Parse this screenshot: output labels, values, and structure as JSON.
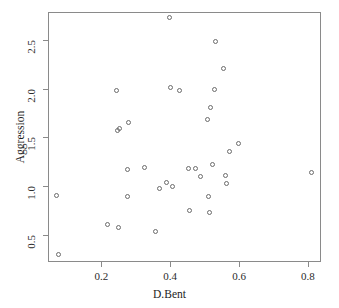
{
  "chart_data": {
    "type": "scatter",
    "title": "",
    "xlabel": "D.Bent",
    "ylabel": "Aggression",
    "xlim": [
      0.045,
      0.838
    ],
    "ylim": [
      0.22,
      2.79
    ],
    "xticks": [
      0.2,
      0.4,
      0.6,
      0.8
    ],
    "xticklabels": [
      "0.2",
      "0.4",
      "0.6",
      "0.8"
    ],
    "yticks": [
      0.5,
      1.0,
      1.5,
      2.0,
      2.5
    ],
    "yticklabels": [
      "0.5",
      "1.0",
      "1.5",
      "2.0",
      "2.5"
    ],
    "grid": false,
    "legend": null,
    "marker": "open-circle",
    "marker_color": "#6b6b6b",
    "n_points": 41,
    "points": [
      {
        "x": 0.07,
        "y": 0.905
      },
      {
        "x": 0.075,
        "y": 0.3
      },
      {
        "x": 0.218,
        "y": 0.607
      },
      {
        "x": 0.245,
        "y": 1.985
      },
      {
        "x": 0.247,
        "y": 1.572
      },
      {
        "x": 0.252,
        "y": 1.592
      },
      {
        "x": 0.25,
        "y": 0.572
      },
      {
        "x": 0.278,
        "y": 1.65
      },
      {
        "x": 0.277,
        "y": 1.175
      },
      {
        "x": 0.276,
        "y": 0.898
      },
      {
        "x": 0.326,
        "y": 1.188
      },
      {
        "x": 0.358,
        "y": 0.53
      },
      {
        "x": 0.37,
        "y": 0.975
      },
      {
        "x": 0.388,
        "y": 1.038
      },
      {
        "x": 0.398,
        "y": 2.73
      },
      {
        "x": 0.4,
        "y": 2.015
      },
      {
        "x": 0.408,
        "y": 0.998
      },
      {
        "x": 0.428,
        "y": 1.978
      },
      {
        "x": 0.452,
        "y": 1.18
      },
      {
        "x": 0.455,
        "y": 0.752
      },
      {
        "x": 0.472,
        "y": 1.185
      },
      {
        "x": 0.488,
        "y": 1.095
      },
      {
        "x": 0.508,
        "y": 1.68
      },
      {
        "x": 0.512,
        "y": 0.898
      },
      {
        "x": 0.515,
        "y": 0.728
      },
      {
        "x": 0.518,
        "y": 1.808
      },
      {
        "x": 0.524,
        "y": 1.222
      },
      {
        "x": 0.528,
        "y": 1.995
      },
      {
        "x": 0.532,
        "y": 2.488
      },
      {
        "x": 0.556,
        "y": 2.208
      },
      {
        "x": 0.562,
        "y": 1.108
      },
      {
        "x": 0.564,
        "y": 1.028
      },
      {
        "x": 0.572,
        "y": 1.352
      },
      {
        "x": 0.598,
        "y": 1.438
      },
      {
        "x": 0.81,
        "y": 1.14
      }
    ]
  },
  "axes": {
    "x_label": "D.Bent",
    "y_label": "Aggression"
  }
}
